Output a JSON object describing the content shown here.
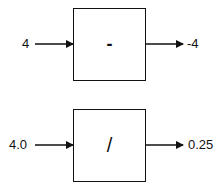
{
  "diagrams": [
    {
      "input": "4",
      "operator": "-",
      "output": "-4"
    },
    {
      "input": "4.0",
      "operator": "/",
      "output": "0.25"
    }
  ]
}
